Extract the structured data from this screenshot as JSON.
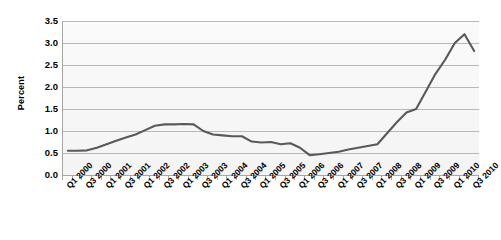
{
  "chart_data": {
    "type": "line",
    "title": "",
    "xlabel": "",
    "ylabel": "Percent",
    "ylim": [
      0.0,
      3.5
    ],
    "ytick_step": 0.5,
    "grid": true,
    "legend": "none",
    "line_color": "#595959",
    "plot_background": "#f7f7f7",
    "gridline_color": "#b8b8b8",
    "axis_color": "#a6a6a6",
    "ytick_labels": [
      "3.5",
      "3.0",
      "2.5",
      "2.0",
      "1.5",
      "1.0",
      "0.5",
      "0.0"
    ],
    "ytick_values": [
      3.5,
      3.0,
      2.5,
      2.0,
      1.5,
      1.0,
      0.5,
      0.0
    ],
    "xtick_labels": [
      "Q1 2000",
      "Q3 2000",
      "Q1 2001",
      "Q3 2001",
      "Q1 2002",
      "Q3 2002",
      "Q1 2003",
      "Q3 2003",
      "Q1 2004",
      "Q3 2004",
      "Q1 2005",
      "Q3 2005",
      "Q1 2006",
      "Q3 2006",
      "Q1 2007",
      "Q3 2007",
      "Q1 2008",
      "Q3 2008",
      "Q1 2009",
      "Q3 2009",
      "Q1 2010",
      "Q3 2010"
    ],
    "x": [
      "Q1 2000",
      "Q2 2000",
      "Q3 2000",
      "Q4 2000",
      "Q1 2001",
      "Q2 2001",
      "Q3 2001",
      "Q4 2001",
      "Q1 2002",
      "Q2 2002",
      "Q3 2002",
      "Q4 2002",
      "Q1 2003",
      "Q2 2003",
      "Q3 2003",
      "Q4 2003",
      "Q1 2004",
      "Q2 2004",
      "Q3 2004",
      "Q4 2004",
      "Q1 2005",
      "Q2 2005",
      "Q3 2005",
      "Q4 2005",
      "Q1 2006",
      "Q2 2006",
      "Q3 2006",
      "Q4 2006",
      "Q1 2007",
      "Q2 2007",
      "Q3 2007",
      "Q4 2007",
      "Q1 2008",
      "Q2 2008",
      "Q3 2008",
      "Q4 2008",
      "Q1 2009",
      "Q2 2009",
      "Q3 2009",
      "Q4 2009",
      "Q1 2010",
      "Q2 2010",
      "Q3 2010"
    ],
    "values": [
      0.55,
      0.55,
      0.56,
      0.62,
      0.7,
      0.78,
      0.85,
      0.92,
      1.02,
      1.12,
      1.15,
      1.15,
      1.16,
      1.15,
      1.0,
      0.92,
      0.9,
      0.88,
      0.88,
      0.76,
      0.74,
      0.75,
      0.7,
      0.72,
      0.62,
      0.45,
      0.47,
      0.5,
      0.53,
      0.58,
      0.62,
      0.66,
      0.7,
      0.95,
      1.2,
      1.42,
      1.5,
      1.9,
      2.3,
      2.62,
      3.0,
      3.2,
      2.82
    ]
  }
}
